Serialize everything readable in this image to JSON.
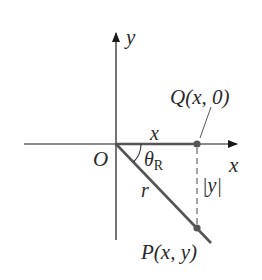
{
  "diagram": {
    "type": "coordinate-geometry",
    "colors": {
      "axis": "#1a1a1a",
      "segment": "#555555",
      "dashed": "#666666",
      "point": "#555555",
      "text": "#2a2a2a",
      "background": "#ffffff"
    },
    "axes": {
      "x_label": "x",
      "y_label": "y",
      "origin_label": "O"
    },
    "points": {
      "Q": {
        "name": "Q",
        "args": "(x, 0)",
        "label": "Q(x, 0)"
      },
      "P": {
        "name": "P",
        "args": "(x, y)",
        "label": "P(x, y)"
      }
    },
    "segments": {
      "horizontal_label": "x",
      "radius_label": "r",
      "vertical_label": "|y|"
    },
    "angle": {
      "symbol": "θ",
      "subscript": "R",
      "label": "θR"
    }
  }
}
